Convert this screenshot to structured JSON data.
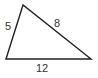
{
  "diagram": {
    "type": "triangle",
    "stroke_color": "#222222",
    "label_color": "#333333",
    "vertices": [
      {
        "x": 23,
        "y": 5
      },
      {
        "x": 6,
        "y": 59
      },
      {
        "x": 91,
        "y": 59
      }
    ],
    "sides": [
      {
        "label": "5",
        "between": "top-left",
        "x": 5,
        "y": 30
      },
      {
        "label": "8",
        "between": "top-right",
        "x": 54,
        "y": 27
      },
      {
        "label": "12",
        "between": "base",
        "x": 36,
        "y": 72
      }
    ]
  }
}
